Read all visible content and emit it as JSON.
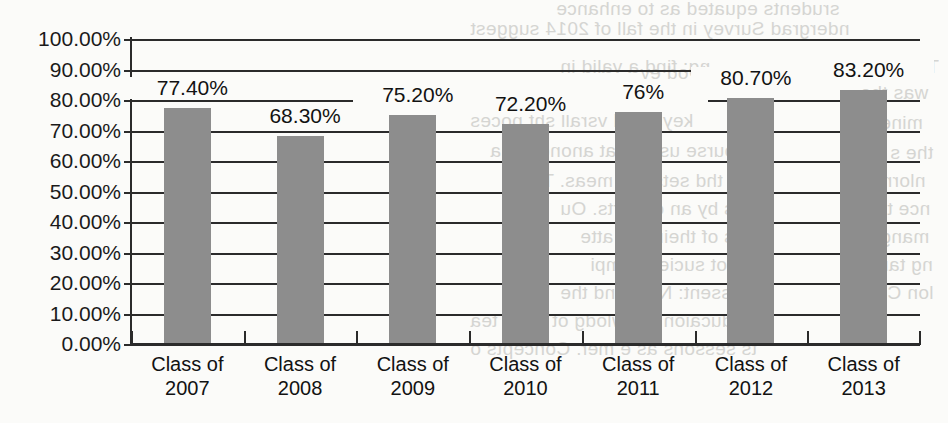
{
  "chart_data": {
    "type": "bar",
    "title": "",
    "subtitle": "",
    "xlabel": "",
    "ylabel": "",
    "categories": [
      "Class of 2007",
      "Class of 2008",
      "Class of 2009",
      "Class of 2010",
      "Class of 2011",
      "Class of 2012",
      "Class of 2013"
    ],
    "category_lines": [
      [
        "Class of",
        "2007"
      ],
      [
        "Class of",
        "2008"
      ],
      [
        "Class of",
        "2009"
      ],
      [
        "Class of",
        "2010"
      ],
      [
        "Class of",
        "2011"
      ],
      [
        "Class of",
        "2012"
      ],
      [
        "Class of",
        "2013"
      ]
    ],
    "values": [
      77.4,
      68.3,
      75.2,
      72.2,
      76.0,
      80.7,
      83.2
    ],
    "data_labels": [
      "77.40%",
      "68.30%",
      "75.20%",
      "72.20%",
      "76%",
      "80.70%",
      "83.20%"
    ],
    "ylim": [
      0,
      100
    ],
    "ytick_values": [
      100,
      90,
      80,
      70,
      60,
      50,
      40,
      30,
      20,
      10,
      0
    ],
    "ytick_labels": [
      "100.00%",
      "90.00%",
      "80.00%",
      "70.00%",
      "60.00%",
      "50.00%",
      "40.00%",
      "30.00%",
      "20.00%",
      "10.00%",
      "0.00%"
    ],
    "grid": true,
    "legend": false,
    "legend_position": "none",
    "bar_color": "#8d8d8d",
    "axis_color": "#2b2b2b",
    "background_color": "#fbfbf9"
  },
  "bleed_through": [
    {
      "text": "srudents equated as to enhance",
      "x": 556,
      "y": -2
    },
    {
      "text": "ndergrad Survey in the fall of 2014 suggest",
      "x": 470,
      "y": 18
    },
    {
      "text": "ng: find a valid in",
      "x": 560,
      "y": 56
    },
    {
      "text": "two brod ev",
      "x": 640,
      "y": 62
    },
    {
      "text": "The",
      "x": 905,
      "y": 56
    },
    {
      "text": "was the",
      "x": 860,
      "y": 82
    },
    {
      "text": "w the res",
      "x": 600,
      "y": 84
    },
    {
      "text": "keysured vsrall sht poces",
      "x": 470,
      "y": 110
    },
    {
      "text": "mine",
      "x": 880,
      "y": 112
    },
    {
      "text": "course uses a at anond a dia",
      "x": 490,
      "y": 140
    },
    {
      "text": "the s",
      "x": 890,
      "y": 142
    },
    {
      "text": "and thd sets are meas. The",
      "x": 520,
      "y": 170
    },
    {
      "text": "nlormd",
      "x": 865,
      "y": 170
    },
    {
      "text": "cos by an or carts. Ou",
      "x": 560,
      "y": 198
    },
    {
      "text": "nce the",
      "x": 865,
      "y": 198
    },
    {
      "text": "ans of their st a atte",
      "x": 580,
      "y": 226
    },
    {
      "text": "mang",
      "x": 880,
      "y": 226
    },
    {
      "text": "the pot suciety. ompi",
      "x": 590,
      "y": 254
    },
    {
      "text": "ng tan s",
      "x": 862,
      "y": 254
    },
    {
      "text": "reassent: NES and the",
      "x": 560,
      "y": 282
    },
    {
      "text": "lon Com",
      "x": 860,
      "y": 282
    },
    {
      "text": "n educaion knowlodg ot most tea",
      "x": 470,
      "y": 310
    },
    {
      "text": "ts sessons as e mer. Concepts o",
      "x": 470,
      "y": 338
    }
  ]
}
